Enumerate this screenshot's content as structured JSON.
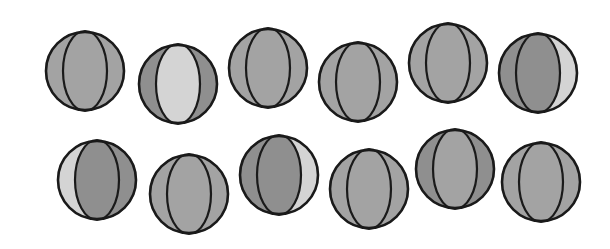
{
  "figure": {
    "background": "#ffffff",
    "outline_color": "#1a1a1a",
    "shade_colors": {
      "dark": "#8f8f8f",
      "mid": "#a3a3a3",
      "light": "#d4d4d4"
    }
  },
  "balls": [
    {
      "id": 1,
      "cx": 85,
      "cy": 71,
      "r": 40,
      "left": "mid",
      "center": "mid",
      "right": "mid"
    },
    {
      "id": 2,
      "cx": 178,
      "cy": 84,
      "r": 40,
      "left": "dark",
      "center": "light",
      "right": "dark"
    },
    {
      "id": 3,
      "cx": 268,
      "cy": 68,
      "r": 40,
      "left": "mid",
      "center": "mid",
      "right": "mid"
    },
    {
      "id": 4,
      "cx": 358,
      "cy": 82,
      "r": 40,
      "left": "mid",
      "center": "mid",
      "right": "mid"
    },
    {
      "id": 5,
      "cx": 448,
      "cy": 63,
      "r": 40,
      "left": "mid",
      "center": "mid",
      "right": "mid"
    },
    {
      "id": 6,
      "cx": 538,
      "cy": 73,
      "r": 40,
      "left": "dark",
      "center": "dark",
      "right": "light"
    },
    {
      "id": 7,
      "cx": 97,
      "cy": 180,
      "r": 40,
      "left": "light",
      "center": "dark",
      "right": "dark"
    },
    {
      "id": 8,
      "cx": 189,
      "cy": 194,
      "r": 40,
      "left": "mid",
      "center": "mid",
      "right": "mid"
    },
    {
      "id": 9,
      "cx": 279,
      "cy": 175,
      "r": 40,
      "left": "dark",
      "center": "dark",
      "right": "light"
    },
    {
      "id": 10,
      "cx": 369,
      "cy": 189,
      "r": 40,
      "left": "mid",
      "center": "mid",
      "right": "mid"
    },
    {
      "id": 11,
      "cx": 455,
      "cy": 169,
      "r": 40,
      "left": "dark",
      "center": "mid",
      "right": "dark"
    },
    {
      "id": 12,
      "cx": 541,
      "cy": 182,
      "r": 40,
      "left": "mid",
      "center": "mid",
      "right": "mid"
    }
  ]
}
